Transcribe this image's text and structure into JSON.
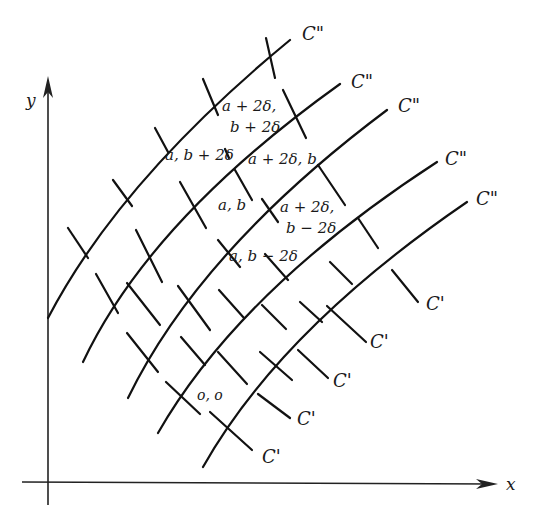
{
  "axes": {
    "x_label": "x",
    "y_label": "y"
  },
  "curve_family_labels": {
    "c_double_prime": [
      "C\"",
      "C\"",
      "C\"",
      "C\"",
      "C\""
    ],
    "c_prime": [
      "C'",
      "C'",
      "C'",
      "C'",
      "C'"
    ]
  },
  "point_labels": {
    "top_a": "a + 2δ,",
    "top_b": "b + 2δ",
    "upper_left": "a, b + 2δ",
    "upper_right": "a + 2δ, b",
    "center": "a, b",
    "right_a": "a + 2δ,",
    "right_b": "b − 2δ",
    "lower": "a, b − 2δ",
    "origin": "o, o"
  },
  "colors": {
    "ink": "#111111",
    "background": "#ffffff"
  }
}
